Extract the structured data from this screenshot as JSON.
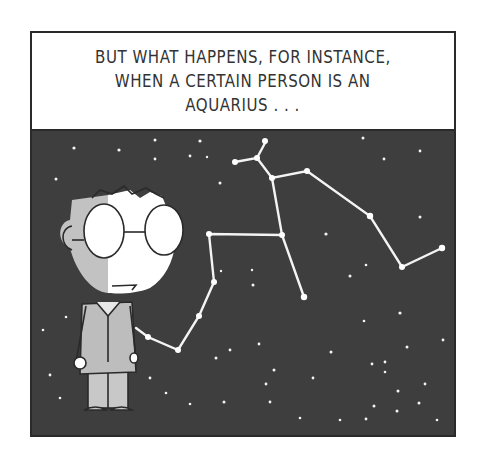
{
  "caption": {
    "lines": [
      "BUT WHAT HAPPENS, FOR INSTANCE,",
      "WHEN A CERTAIN PERSON IS AN",
      "AQUARIUS . . ."
    ]
  },
  "scene": {
    "background_color": "#3e3e3e",
    "star_color": "#f4f4f4",
    "character": "boy-with-glasses",
    "constellation": "aquarius"
  }
}
